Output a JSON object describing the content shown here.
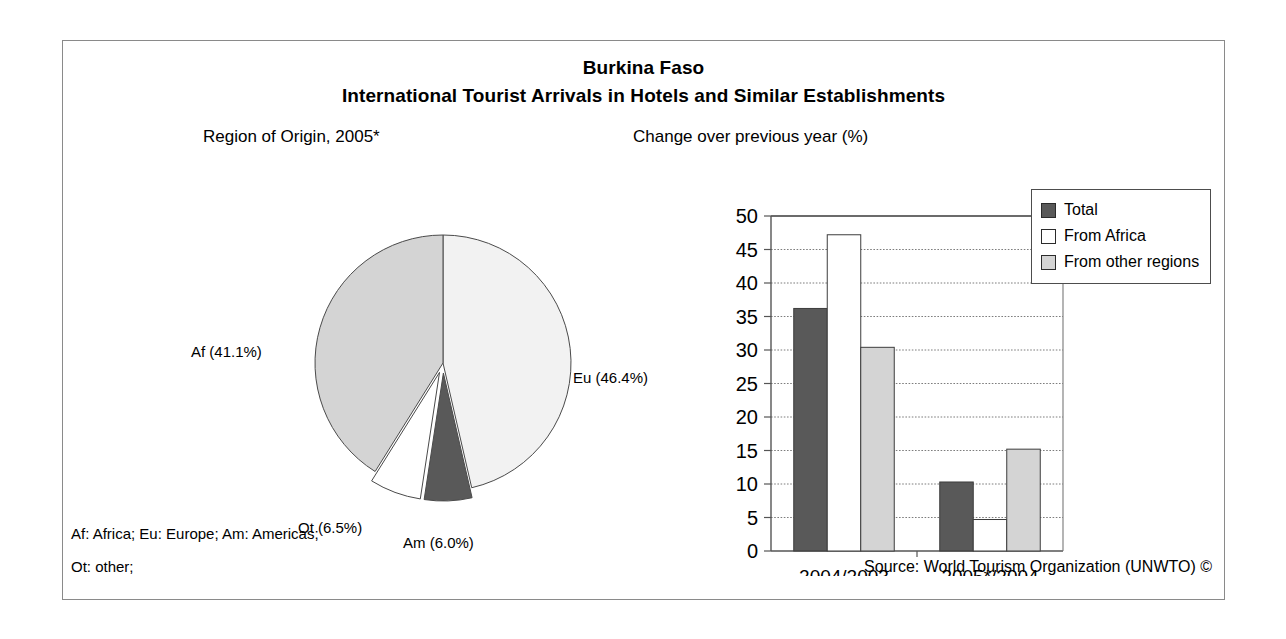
{
  "header": {
    "country": "Burkina Faso",
    "subtitle": "International Tourist Arrivals in Hotels and Similar Establishments"
  },
  "pie_panel": {
    "title": "Region of Origin, 2005*",
    "labels": {
      "af": "Af (41.1%)",
      "eu": "Eu (46.4%)",
      "ot": "Ot (6.5%)",
      "am": "Am (6.0%)"
    }
  },
  "bar_panel": {
    "title": "Change over previous year (%)"
  },
  "legend": {
    "items": [
      {
        "label": "Total",
        "color": "#595959"
      },
      {
        "label": "From Africa",
        "color": "#ffffff"
      },
      {
        "label": "From other regions",
        "color": "#d4d4d4"
      }
    ]
  },
  "footnotes": {
    "line1": "Af: Africa; Eu: Europe; Am: Americas;",
    "line2": "Ot: other;",
    "source": "Source: World Tourism Organization (UNWTO) ©"
  },
  "chart_data": [
    {
      "type": "pie",
      "title": "Region of Origin, 2005*",
      "categories": [
        "Eu",
        "Am",
        "Ot",
        "Af"
      ],
      "category_names": [
        "Europe",
        "Americas",
        "other",
        "Africa"
      ],
      "values": [
        46.4,
        6.0,
        6.5,
        41.1
      ],
      "labels": [
        "Eu (46.4%)",
        "Am (6.0%)",
        "Ot (6.5%)",
        "Af (41.1%)"
      ],
      "colors": [
        "#f2f2f2",
        "#595959",
        "#ffffff",
        "#d4d4d4"
      ],
      "exploded": [
        false,
        true,
        true,
        false
      ],
      "unit": "%",
      "legend": "none"
    },
    {
      "type": "bar",
      "title": "Change over previous year (%)",
      "categories": [
        "2004/2003",
        "2005*/2004"
      ],
      "series": [
        {
          "name": "Total",
          "values": [
            36.2,
            10.3
          ],
          "color": "#595959"
        },
        {
          "name": "From Africa",
          "values": [
            47.2,
            4.7
          ],
          "color": "#ffffff"
        },
        {
          "name": "From other regions",
          "values": [
            30.4,
            15.2
          ],
          "color": "#d4d4d4"
        }
      ],
      "xlabel": "",
      "ylabel": "",
      "ylim": [
        0,
        50
      ],
      "yticks": [
        0,
        5,
        10,
        15,
        20,
        25,
        30,
        35,
        40,
        45,
        50
      ],
      "ytick_labels": [
        "0",
        "5",
        "10",
        "15",
        "20",
        "25",
        "30",
        "35",
        "40",
        "45",
        "50"
      ],
      "grid": true,
      "legend_position": "right"
    }
  ]
}
